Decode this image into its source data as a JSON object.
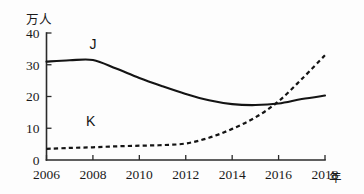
{
  "chart_data": {
    "type": "line",
    "title": "",
    "xlabel": "年",
    "ylabel": "万人",
    "y_unit_label": "万人",
    "x_unit_label": "年",
    "xlim": [
      2006,
      2018
    ],
    "ylim": [
      0,
      40
    ],
    "grid": false,
    "legend": "inline-labels",
    "y_ticks": [
      "0",
      "10",
      "20",
      "30",
      "40"
    ],
    "y_tick_values": [
      0,
      10,
      20,
      30,
      40
    ],
    "x_ticks": [
      "2006",
      "2008",
      "2010",
      "2012",
      "2014",
      "2016",
      "2018"
    ],
    "x_tick_values": [
      2006,
      2008,
      2010,
      2012,
      2014,
      2016,
      2018
    ],
    "x": [
      2006,
      2007,
      2008,
      2009,
      2010,
      2011,
      2012,
      2013,
      2014,
      2015,
      2016,
      2017,
      2018
    ],
    "series": [
      {
        "name": "J",
        "label": "J",
        "style": "solid",
        "values": [
          31.0,
          31.4,
          31.5,
          28.8,
          25.8,
          23.2,
          20.8,
          18.8,
          17.6,
          17.3,
          17.8,
          19.2,
          20.3
        ]
      },
      {
        "name": "K",
        "label": "K",
        "style": "dashed",
        "values": [
          3.5,
          3.8,
          4.0,
          4.3,
          4.5,
          4.7,
          5.2,
          7.0,
          9.8,
          13.4,
          18.5,
          25.5,
          33.0
        ]
      }
    ],
    "annotations": [
      {
        "text": "J",
        "x": 2008.0,
        "y": 35.0
      },
      {
        "text": "K",
        "x": 2007.9,
        "y": 10.6
      }
    ],
    "crossing_point": {
      "x": 2015.6,
      "y": 18.0
    }
  },
  "colors": {
    "background": "#fdfdfd",
    "axis": "#2a2a2a",
    "series_j": "#141414",
    "series_k": "#141414",
    "text": "#1a1a1a"
  }
}
